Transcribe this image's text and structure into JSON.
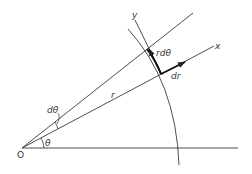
{
  "diagram": {
    "title": "",
    "colors": {
      "line": "#3a3a3a",
      "background": "#ffffff"
    },
    "labels": {
      "origin": "O",
      "theta": "θ",
      "dtheta": "dθ",
      "r": "r",
      "x_axis": "x",
      "y_axis": "y",
      "r_dtheta": "rdθ",
      "dr": "dr"
    },
    "elements": [
      {
        "type": "line",
        "name": "horizontal-axis",
        "from": [
          22,
          148
        ],
        "to": [
          238,
          148
        ]
      },
      {
        "type": "ray",
        "name": "radial-line-r",
        "from": [
          22,
          148
        ],
        "to": [
          214,
          46
        ],
        "label": "r"
      },
      {
        "type": "ray",
        "name": "radial-line-r-plus-dtheta",
        "from": [
          22,
          148
        ],
        "to": [
          193,
          13
        ]
      },
      {
        "type": "arc",
        "name": "arc-r",
        "center": [
          22,
          148
        ],
        "label": "arc at radius r"
      },
      {
        "type": "arrow",
        "name": "dr-vector",
        "label": "dr"
      },
      {
        "type": "arrow",
        "name": "r-dtheta-vector",
        "label": "rdθ"
      },
      {
        "type": "angle",
        "name": "theta-angle",
        "label": "θ"
      },
      {
        "type": "angle",
        "name": "dtheta-angle",
        "label": "dθ"
      }
    ]
  }
}
